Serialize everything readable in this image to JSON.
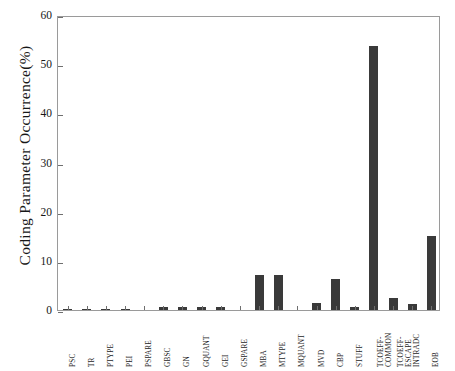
{
  "chart_data": {
    "type": "bar",
    "title": "",
    "xlabel": "",
    "ylabel": "Coding  Parameter  Occurrence(%)",
    "ylim": [
      0,
      60
    ],
    "yticks": [
      0,
      10,
      20,
      30,
      40,
      50,
      60
    ],
    "grid": false,
    "legend": null,
    "bar_color": "#3a3a3a",
    "categories": [
      "PSC",
      "TR",
      "PTYPE",
      "PEI",
      "PSPARE",
      "GBSC",
      "GN",
      "GQUANT",
      "GEI",
      "GSPARE",
      "MBA",
      "MTYPE",
      "MQUANT",
      "MVD",
      "CBP",
      "STUFF",
      "TCOEFF-\nCOMMON",
      "TCOEFF-\nESCAPE",
      "INTRADC",
      "EOB"
    ],
    "values": [
      0.2,
      0.2,
      0.2,
      0.2,
      0.0,
      0.6,
      0.6,
      0.6,
      0.6,
      0.0,
      7.1,
      7.1,
      0.0,
      1.5,
      6.3,
      0.7,
      53.7,
      2.5,
      1.2,
      15.0
    ]
  },
  "axes": {
    "y_tick_labels": [
      "0",
      "10",
      "20",
      "30",
      "40",
      "50",
      "60"
    ],
    "y_axis_title": "Coding  Parameter  Occurrence(%)"
  }
}
